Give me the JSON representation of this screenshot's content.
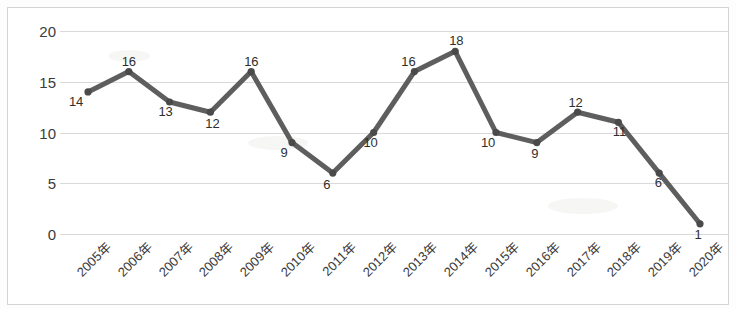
{
  "chart_data": {
    "type": "line",
    "title": "",
    "xlabel": "",
    "ylabel": "",
    "categories": [
      "2005年",
      "2006年",
      "2007年",
      "2008年",
      "2009年",
      "2010年",
      "2011年",
      "2012年",
      "2013年",
      "2014年",
      "2015年",
      "2016年",
      "2017年",
      "2018年",
      "2019年",
      "2020年"
    ],
    "values": [
      14,
      16,
      13,
      12,
      16,
      9,
      6,
      10,
      16,
      18,
      10,
      9,
      12,
      11,
      6,
      1
    ],
    "series": [
      {
        "name": "",
        "values": [
          14,
          16,
          13,
          12,
          16,
          9,
          6,
          10,
          16,
          18,
          10,
          9,
          12,
          11,
          6,
          1
        ]
      }
    ],
    "data_labels": [
      "14",
      "16",
      "13",
      "12",
      "16",
      "9",
      "6",
      "10",
      "16",
      "18",
      "10",
      "9",
      "12",
      "11",
      "6",
      "1"
    ],
    "ylim": [
      0,
      20
    ],
    "yticks": [
      0,
      5,
      10,
      15,
      20
    ],
    "ytick_labels": [
      "0",
      "5",
      "10",
      "15",
      "20"
    ],
    "grid": true,
    "grid_axis": "y",
    "legend": "none",
    "line_color": "#5e5e5e",
    "marker": "circle",
    "marker_color": "#4a4a4a",
    "gridline_color": "#d9d9d9",
    "border_color": "#d4d4d4",
    "axis_text_color": "#3b3b3b",
    "label_rotation_deg": -45
  }
}
